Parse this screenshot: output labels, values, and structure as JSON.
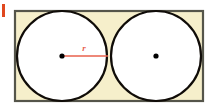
{
  "figure": {
    "canvas": {
      "width": 212,
      "height": 107,
      "background": "#ffffff"
    },
    "rectangle": {
      "name": "bounding-rectangle",
      "x": 15,
      "y": 11,
      "width": 188,
      "height": 90,
      "fill_color": "#f6efcb",
      "stroke_color": "#55554a",
      "stroke_width": 2.2
    },
    "circles": [
      {
        "name": "left-circle",
        "cx": 62,
        "cy": 56,
        "r": 45,
        "fill_color": "#ffffff",
        "stroke_color": "#100c08",
        "stroke_width": 2.2
      },
      {
        "name": "right-circle",
        "cx": 156,
        "cy": 56,
        "r": 45,
        "fill_color": "#ffffff",
        "stroke_color": "#100c08",
        "stroke_width": 2.2
      }
    ],
    "center_dots": [
      {
        "name": "left-center-dot",
        "cx": 62,
        "cy": 56,
        "r": 2.6,
        "color": "#000000"
      },
      {
        "name": "right-center-dot",
        "cx": 156,
        "cy": 56,
        "r": 2.6,
        "color": "#000000"
      }
    ],
    "radius_segment": {
      "name": "radius-line",
      "x1": 62,
      "y1": 56,
      "x2": 108,
      "y2": 56,
      "color": "#e8604c",
      "stroke_width": 1.6,
      "label": "r",
      "label_color": "#e8604c",
      "label_x": 84,
      "label_y": 51,
      "label_font_size": 9
    },
    "edge_marker": {
      "name": "left-edge-orange-marker",
      "x": 2,
      "y": 4,
      "width": 3,
      "height": 13,
      "color": "#e0481f"
    }
  }
}
